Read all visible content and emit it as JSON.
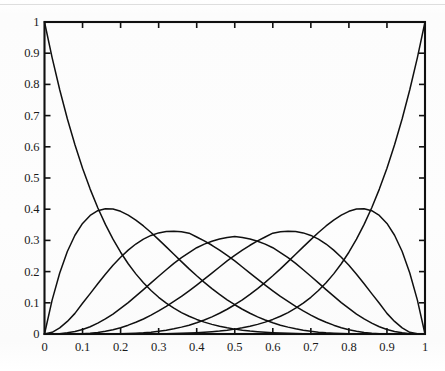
{
  "chart_data": {
    "type": "line",
    "title": "",
    "subtitle": "",
    "xlabel": "",
    "ylabel": "",
    "xlim": [
      0,
      1
    ],
    "ylim": [
      0,
      1
    ],
    "grid": false,
    "legend": false,
    "legend_position": "none",
    "annotations": [],
    "xticks": [
      0,
      0.1,
      0.2,
      0.3,
      0.4,
      0.5,
      0.6,
      0.7,
      0.8,
      0.9,
      1
    ],
    "xticklabels": [
      "0",
      "0.1",
      "0.2",
      "0.3",
      "0.4",
      "0.5",
      "0.6",
      "0.7",
      "0.8",
      "0.9",
      "1"
    ],
    "yticks": [
      0,
      0.1,
      0.2,
      0.3,
      0.4,
      0.5,
      0.6,
      0.7,
      0.8,
      0.9,
      1
    ],
    "yticklabels": [
      "0",
      "0.1",
      "0.2",
      "0.3",
      "0.4",
      "0.5",
      "0.6",
      "0.7",
      "0.8",
      "0.9",
      "1"
    ],
    "line_color": "#101010",
    "line_width": 1.5,
    "background_color": "#fdfdfd",
    "axis_color": "#101010",
    "x": [
      0,
      0.02,
      0.04,
      0.06,
      0.08,
      0.1,
      0.12,
      0.14,
      0.16,
      0.18,
      0.2,
      0.22,
      0.24,
      0.26,
      0.28,
      0.3,
      0.32,
      0.34,
      0.36,
      0.38,
      0.4,
      0.42,
      0.44,
      0.46,
      0.48,
      0.5,
      0.52,
      0.54,
      0.56,
      0.58,
      0.6,
      0.62,
      0.64,
      0.66,
      0.68,
      0.7,
      0.72,
      0.74,
      0.76,
      0.78,
      0.8,
      0.82,
      0.84,
      0.86,
      0.88,
      0.9,
      0.92,
      0.94,
      0.96,
      0.98,
      1
    ],
    "series": [
      {
        "name": "B0,6 = (1-x)^6",
        "peak_x": 0,
        "peak_y": 1,
        "values": [
          1,
          0.8858,
          0.7828,
          0.6899,
          0.6064,
          0.5314,
          0.4644,
          0.4046,
          0.3513,
          0.304,
          0.2621,
          0.2252,
          0.1927,
          0.1642,
          0.1393,
          0.1176,
          0.0989,
          0.0827,
          0.0687,
          0.0568,
          0.0467,
          0.0381,
          0.0308,
          0.0248,
          0.0198,
          0.0156,
          0.0122,
          0.0095,
          0.0073,
          0.0055,
          0.0041,
          0.003,
          0.0022,
          0.0015,
          0.001,
          0.0007,
          0.0005,
          0.0003,
          0.0002,
          0.0001,
          0.0001,
          0,
          0,
          0,
          0,
          0,
          0,
          0,
          0,
          0,
          0
        ]
      },
      {
        "name": "B1,6 = 6x(1-x)^5",
        "peak_x": 0.1667,
        "peak_y": 0.4019,
        "values": [
          0,
          0.1085,
          0.1957,
          0.2643,
          0.3164,
          0.3543,
          0.3799,
          0.3952,
          0.4015,
          0.4004,
          0.3932,
          0.3811,
          0.3652,
          0.3463,
          0.3253,
          0.3025,
          0.2793,
          0.2555,
          0.2319,
          0.2087,
          0.1866,
          0.1655,
          0.1456,
          0.1272,
          0.1097,
          0.0938,
          0.0794,
          0.0664,
          0.0549,
          0.0449,
          0.0359,
          0.0283,
          0.022,
          0.0166,
          0.0123,
          0.0088,
          0.006,
          0.0039,
          0.0024,
          0.0013,
          0.0006,
          0.0003,
          0.0001,
          0,
          0,
          0,
          0,
          0,
          0,
          0,
          0
        ]
      },
      {
        "name": "B2,6 = 15x^2(1-x)^4",
        "peak_x": 0.3333,
        "peak_y": 0.3292,
        "values": [
          0,
          0.0055,
          0.0196,
          0.0404,
          0.0661,
          0.0984,
          0.1295,
          0.1609,
          0.1916,
          0.2203,
          0.2458,
          0.2688,
          0.2884,
          0.3041,
          0.3159,
          0.324,
          0.3286,
          0.3297,
          0.3278,
          0.3232,
          0.311,
          0.2985,
          0.2844,
          0.2685,
          0.2517,
          0.2344,
          0.2148,
          0.1951,
          0.1758,
          0.1567,
          0.1382,
          0.1203,
          0.1043,
          0.0886,
          0.0739,
          0.0607,
          0.0482,
          0.0375,
          0.0283,
          0.0203,
          0.0138,
          0.0087,
          0.005,
          0.0025,
          0.001,
          0.0003,
          0.0001,
          0,
          0,
          0,
          0
        ]
      },
      {
        "name": "B3,6 = 20x^3(1-x)^3",
        "peak_x": 0.5,
        "peak_y": 0.3125,
        "values": [
          0,
          0.0002,
          0.0012,
          0.0038,
          0.0081,
          0.0146,
          0.0234,
          0.0347,
          0.0482,
          0.0639,
          0.0819,
          0.1007,
          0.1214,
          0.1424,
          0.1638,
          0.1852,
          0.206,
          0.2263,
          0.2447,
          0.2611,
          0.2765,
          0.2881,
          0.2971,
          0.3044,
          0.3096,
          0.3125,
          0.3096,
          0.3044,
          0.2971,
          0.2881,
          0.2765,
          0.2611,
          0.2447,
          0.2263,
          0.206,
          0.1852,
          0.1638,
          0.1424,
          0.1214,
          0.1007,
          0.0819,
          0.0639,
          0.0482,
          0.0347,
          0.0234,
          0.0146,
          0.0081,
          0.0038,
          0.0012,
          0.0002,
          0
        ]
      },
      {
        "name": "B4,6 = 15x^4(1-x)^2",
        "peak_x": 0.6667,
        "peak_y": 0.3292,
        "values": [
          0,
          0,
          0,
          0.0001,
          0.0003,
          0.001,
          0.0024,
          0.005,
          0.0087,
          0.0138,
          0.0203,
          0.0283,
          0.0375,
          0.0482,
          0.0607,
          0.0739,
          0.0886,
          0.1043,
          0.1203,
          0.1382,
          0.1567,
          0.1758,
          0.1951,
          0.2148,
          0.2344,
          0.2517,
          0.2685,
          0.2844,
          0.2985,
          0.311,
          0.3232,
          0.3278,
          0.3297,
          0.3286,
          0.324,
          0.3159,
          0.3041,
          0.2884,
          0.2688,
          0.2458,
          0.2203,
          0.1916,
          0.1609,
          0.1295,
          0.0984,
          0.0661,
          0.0404,
          0.0196,
          0.0055,
          0.0008,
          0
        ]
      },
      {
        "name": "B5,6 = 6x^5(1-x)",
        "peak_x": 0.8333,
        "peak_y": 0.4019,
        "values": [
          0,
          0,
          0,
          0,
          0,
          0,
          0,
          0,
          0.0001,
          0.0003,
          0.0006,
          0.0013,
          0.0024,
          0.0039,
          0.006,
          0.0088,
          0.0123,
          0.0166,
          0.022,
          0.0283,
          0.0359,
          0.0449,
          0.0549,
          0.0664,
          0.0794,
          0.0938,
          0.1097,
          0.1272,
          0.1456,
          0.1655,
          0.1866,
          0.2087,
          0.2319,
          0.2555,
          0.2793,
          0.3025,
          0.3253,
          0.3463,
          0.3652,
          0.3811,
          0.3932,
          0.4004,
          0.4015,
          0.3952,
          0.3799,
          0.3543,
          0.3164,
          0.2643,
          0.1957,
          0.1085,
          0
        ]
      },
      {
        "name": "B6,6 = x^6",
        "peak_x": 1,
        "peak_y": 1,
        "values": [
          0,
          0,
          0,
          0,
          0,
          0,
          0,
          0,
          0,
          0,
          0.0001,
          0.0001,
          0.0002,
          0.0003,
          0.0005,
          0.0007,
          0.001,
          0.0015,
          0.0022,
          0.003,
          0.0041,
          0.0055,
          0.0073,
          0.0095,
          0.0122,
          0.0156,
          0.0198,
          0.0248,
          0.0308,
          0.0381,
          0.0467,
          0.0568,
          0.0687,
          0.0827,
          0.0989,
          0.1176,
          0.1393,
          0.1642,
          0.1927,
          0.2252,
          0.2621,
          0.304,
          0.3513,
          0.4046,
          0.4644,
          0.5314,
          0.6064,
          0.6899,
          0.7828,
          0.8858,
          1
        ]
      }
    ]
  }
}
